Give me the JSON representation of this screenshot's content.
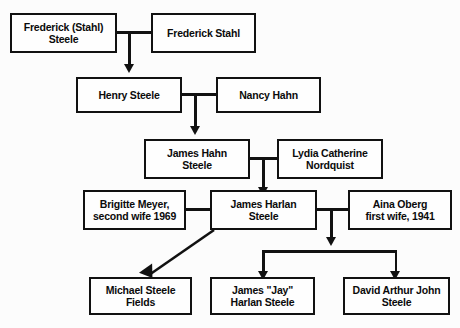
{
  "diagram": {
    "type": "family-tree",
    "background_color": "#fcfcfc",
    "box_border_color": "#111111",
    "box_fill_color": "#fefefe",
    "nodes": [
      {
        "id": "frederick-stahl-steele",
        "line1": "Frederick (Stahl)",
        "line2": "Steele",
        "generation": 1
      },
      {
        "id": "frederick-stahl",
        "line1": "Frederick Stahl",
        "line2": "",
        "generation": 1
      },
      {
        "id": "henry-steele",
        "line1": "Henry Steele",
        "line2": "",
        "generation": 2
      },
      {
        "id": "nancy-hahn",
        "line1": "Nancy Hahn",
        "line2": "",
        "generation": 2
      },
      {
        "id": "james-hahn-steele",
        "line1": "James Hahn",
        "line2": "Steele",
        "generation": 3
      },
      {
        "id": "lydia-catherine-nordquist",
        "line1": "Lydia Catherine",
        "line2": "Nordquist",
        "generation": 3
      },
      {
        "id": "brigitte-meyer",
        "line1": "Brigitte Meyer,",
        "line2": "second wife 1969",
        "generation": 4
      },
      {
        "id": "james-harlan-steele",
        "line1": "James Harlan",
        "line2": "Steele",
        "generation": 4
      },
      {
        "id": "aina-oberg",
        "line1": "Aina Oberg",
        "line2": "first wife, 1941",
        "generation": 4
      },
      {
        "id": "michael-steele-fields",
        "line1": "Michael Steele",
        "line2": "Fields",
        "generation": 5
      },
      {
        "id": "james-jay-harlan-steele",
        "line1": "James \"Jay\"",
        "line2": "Harlan Steele",
        "generation": 5
      },
      {
        "id": "david-arthur-john-steele",
        "line1": "David Arthur John",
        "line2": "Steele",
        "generation": 5
      }
    ]
  }
}
